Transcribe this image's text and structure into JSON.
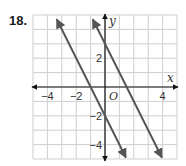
{
  "problem": {
    "number": "18."
  },
  "chart_data": {
    "type": "line",
    "title": "",
    "xlabel": "x",
    "ylabel": "y",
    "origin_label": "O",
    "xlim": [
      -5,
      5
    ],
    "ylim": [
      -5,
      5
    ],
    "grid": true,
    "x_tick_labels": [
      {
        "value": -4,
        "label": "−4"
      },
      {
        "value": -2,
        "label": "−2"
      },
      {
        "value": 4,
        "label": "4"
      }
    ],
    "y_tick_labels": [
      {
        "value": 2,
        "label": "2"
      },
      {
        "value": -2,
        "label": "−2"
      },
      {
        "value": -4,
        "label": "−4"
      }
    ],
    "series": [
      {
        "name": "line-1",
        "equation": "y = -2x - 2",
        "slope": -2,
        "intercept": -2,
        "x_range": [
          -3.35,
          1.45
        ],
        "points": [
          [
            -1,
            0
          ],
          [
            0,
            -2
          ]
        ]
      },
      {
        "name": "line-2",
        "equation": "y = -2x + 3",
        "slope": -2,
        "intercept": 3,
        "x_range": [
          -0.85,
          3.95
        ],
        "points": [
          [
            0,
            3
          ],
          [
            1.5,
            0
          ]
        ]
      }
    ],
    "colors": {
      "line": "#555555",
      "grid": "#cfcfcf",
      "axis": "#111111"
    }
  }
}
